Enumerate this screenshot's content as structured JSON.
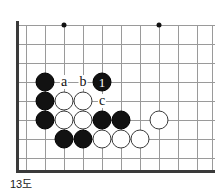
{
  "figure": {
    "caption": "13도",
    "type": "go-board-diagram"
  },
  "board": {
    "grid": {
      "x_positions": [
        16,
        26,
        45,
        64,
        83,
        102,
        121,
        140,
        159,
        178,
        197,
        212
      ],
      "y_positions": [
        25,
        44,
        63,
        82,
        101,
        120,
        139,
        158
      ],
      "spacing": 19,
      "left_edge_x": 16,
      "bottom_edge_y": 170,
      "line_color": "#9a9a9a",
      "edge_color": "#3a3a3a"
    },
    "star_points": [
      {
        "x": 64,
        "y": 25
      },
      {
        "x": 159,
        "y": 25
      },
      {
        "x": 159,
        "y": 120
      }
    ],
    "stones": [
      {
        "color": "black",
        "x": 45,
        "y": 82
      },
      {
        "color": "black",
        "x": 45,
        "y": 101
      },
      {
        "color": "black",
        "x": 45,
        "y": 120
      },
      {
        "color": "black",
        "x": 102,
        "y": 82,
        "label": "1"
      },
      {
        "color": "white",
        "x": 64,
        "y": 101
      },
      {
        "color": "white",
        "x": 83,
        "y": 101
      },
      {
        "color": "white",
        "x": 64,
        "y": 120
      },
      {
        "color": "white",
        "x": 83,
        "y": 120
      },
      {
        "color": "black",
        "x": 102,
        "y": 120
      },
      {
        "color": "black",
        "x": 121,
        "y": 120
      },
      {
        "color": "black",
        "x": 64,
        "y": 139
      },
      {
        "color": "black",
        "x": 83,
        "y": 139
      },
      {
        "color": "white",
        "x": 102,
        "y": 139
      },
      {
        "color": "white",
        "x": 121,
        "y": 139
      },
      {
        "color": "white",
        "x": 140,
        "y": 139
      },
      {
        "color": "white",
        "x": 159,
        "y": 120
      }
    ],
    "markers": [
      {
        "text": "a",
        "x": 64,
        "y": 82
      },
      {
        "text": "b",
        "x": 83,
        "y": 82
      },
      {
        "text": "c",
        "x": 102,
        "y": 101
      }
    ]
  }
}
